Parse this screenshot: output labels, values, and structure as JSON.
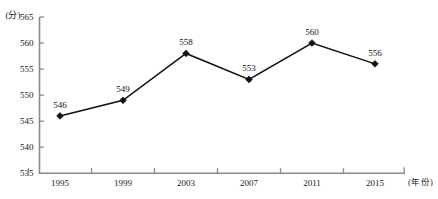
{
  "chart_data": {
    "type": "line",
    "title": "",
    "xlabel": "(年份)",
    "ylabel": "(分)",
    "categories": [
      "1995",
      "1999",
      "2003",
      "2007",
      "2011",
      "2015"
    ],
    "values": [
      546,
      549,
      558,
      553,
      560,
      556
    ],
    "series": [
      {
        "name": "",
        "values": [
          546,
          549,
          558,
          553,
          560,
          556
        ]
      }
    ],
    "point_labels": [
      "546",
      "549",
      "558",
      "553",
      "560",
      "556"
    ],
    "ylim": [
      535,
      565
    ],
    "ytick_step": 5,
    "yticks": [
      "535",
      "540",
      "545",
      "550",
      "555",
      "560",
      "565"
    ],
    "xticks": [
      "1995",
      "1999",
      "2003",
      "2007",
      "2011",
      "2015"
    ],
    "grid": false,
    "legend": "none",
    "marker": "diamond",
    "colors": {
      "line": "#111111",
      "marker": "#111111",
      "axis": "#8a8a8a",
      "text": "#1a1a1a",
      "background": "#ffffff"
    }
  }
}
